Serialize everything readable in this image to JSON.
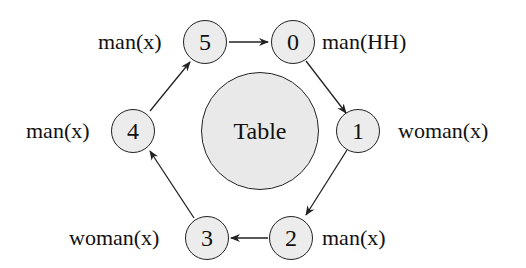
{
  "diagram": {
    "table": {
      "label": "Table"
    },
    "nodes": [
      {
        "id": "0",
        "role": "man(HH)"
      },
      {
        "id": "1",
        "role": "woman(x)"
      },
      {
        "id": "2",
        "role": "man(x)"
      },
      {
        "id": "3",
        "role": "woman(x)"
      },
      {
        "id": "4",
        "role": "man(x)"
      },
      {
        "id": "5",
        "role": "man(x)"
      }
    ],
    "edges": [
      {
        "from": "0",
        "to": "1"
      },
      {
        "from": "1",
        "to": "2"
      },
      {
        "from": "2",
        "to": "3"
      },
      {
        "from": "3",
        "to": "4"
      },
      {
        "from": "4",
        "to": "5"
      },
      {
        "from": "5",
        "to": "0"
      }
    ],
    "colors": {
      "node_fill": "#ececec",
      "stroke": "#222222",
      "background": "#ffffff"
    }
  }
}
